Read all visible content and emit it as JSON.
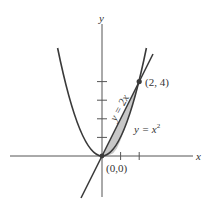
{
  "diagram": {
    "type": "function-plot",
    "axes": {
      "x_label": "x",
      "y_label": "y",
      "x_ticks": [
        1,
        2
      ],
      "y_ticks": [
        1,
        2,
        3,
        4
      ]
    },
    "curves": [
      {
        "name": "parabola",
        "equation": "y = x^2",
        "label_base": "y = x",
        "label_exp": "2"
      },
      {
        "name": "line",
        "equation": "y = 2x",
        "label": "y = 2x"
      }
    ],
    "points": [
      {
        "label": "(0,0)",
        "x": 0,
        "y": 0
      },
      {
        "label": "(2, 4)",
        "x": 2,
        "y": 4
      }
    ],
    "shaded_region": "area between y = 2x and y = x^2 for 0 ≤ x ≤ 2",
    "colors": {
      "curve": "#3a3a3a",
      "axis": "#555555",
      "shade": "#c8c8c8",
      "point": "#3a3a3a"
    }
  }
}
